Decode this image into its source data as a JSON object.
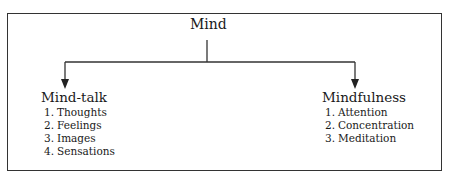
{
  "diagram": {
    "root": {
      "label": "Mind"
    },
    "branches": [
      {
        "title": "Mind-talk",
        "items": [
          {
            "num": "1.",
            "label": "Thoughts"
          },
          {
            "num": "2.",
            "label": "Feelings"
          },
          {
            "num": "3.",
            "label": "Images"
          },
          {
            "num": "4.",
            "label": "Sensations"
          }
        ]
      },
      {
        "title": "Mindfulness",
        "items": [
          {
            "num": "1.",
            "label": "Attention"
          },
          {
            "num": "2.",
            "label": "Concentration"
          },
          {
            "num": "3.",
            "label": "Meditation"
          }
        ]
      }
    ],
    "colors": {
      "line": "#333333",
      "text": "#1a1a1a",
      "background": "#ffffff"
    }
  }
}
